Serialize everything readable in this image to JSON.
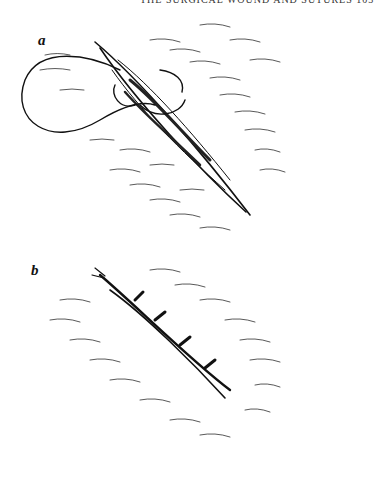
{
  "page": {
    "running_header": "THE SURGICAL WOUND AND SUTURES 103",
    "figure_a_label": "a",
    "figure_b_label": "b"
  },
  "figures": [
    {
      "id": "a",
      "description": "Open incision with suture needle and thread being passed through wound edges"
    },
    {
      "id": "b",
      "description": "Closed wound with interrupted sutures, healed edges"
    }
  ],
  "colors": {
    "ink": "#111111",
    "background": "#ffffff"
  }
}
